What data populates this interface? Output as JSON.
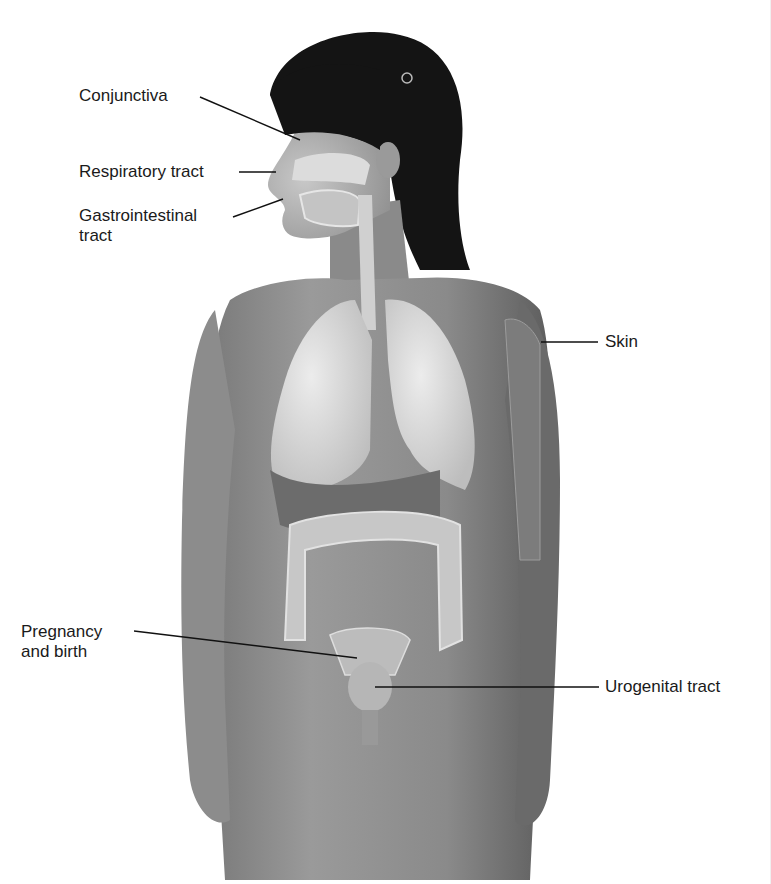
{
  "diagram": {
    "style": "grayscale-illustration",
    "colors": {
      "background": "#ffffff",
      "label_text": "#1a1a1a",
      "leader_line": "#111111",
      "hair": "#141414",
      "skin_dark": "#6e6e6e",
      "skin_mid": "#8d8d8d",
      "organ_light": "#d8d8d8"
    },
    "labels": [
      {
        "id": "conjunctiva",
        "text": "Conjunctiva",
        "side": "left"
      },
      {
        "id": "respiratory",
        "text": "Respiratory tract",
        "side": "left"
      },
      {
        "id": "gastrointestinal",
        "text": "Gastrointestinal\ntract",
        "side": "left"
      },
      {
        "id": "skin",
        "text": "Skin",
        "side": "right"
      },
      {
        "id": "pregnancy",
        "text": "Pregnancy\nand birth",
        "side": "left"
      },
      {
        "id": "urogenital",
        "text": "Urogenital tract",
        "side": "right"
      }
    ]
  }
}
